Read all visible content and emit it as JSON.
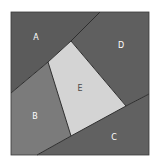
{
  "diagram": {
    "frame": {
      "x": 11,
      "y": 12,
      "width": 138,
      "height": 143,
      "stroke": "#3a3a3a"
    },
    "regions": [
      {
        "id": "A",
        "label": "A",
        "fill": "#5b5b5b",
        "points": "11,12 100,12 71,41 48,62 11,93",
        "label_pos": {
          "x": 36,
          "y": 37
        }
      },
      {
        "id": "D",
        "label": "D",
        "fill": "#5f5f5f",
        "points": "100,12 149,12 149,94 126,106 71,41",
        "label_pos": {
          "x": 121,
          "y": 45
        }
      },
      {
        "id": "E",
        "label": "E",
        "fill": "#d4d4d4",
        "points": "71,41 48,62 71,136 126,106",
        "label_pos": {
          "x": 80,
          "y": 88
        }
      },
      {
        "id": "B",
        "label": "B",
        "fill": "#7b7b7b",
        "points": "11,93 48,62 71,136 37,155 11,155",
        "label_pos": {
          "x": 35,
          "y": 116
        }
      },
      {
        "id": "C",
        "label": "C",
        "fill": "#616161",
        "points": "37,155 71,136 126,106 149,94 149,155",
        "label_pos": {
          "x": 114,
          "y": 137
        }
      }
    ],
    "lines": [
      {
        "id": "A-D-boundary",
        "points": "100,12 71,41"
      },
      {
        "id": "A-E-boundary",
        "points": "71,41 48,62"
      },
      {
        "id": "A-B-boundary",
        "points": "48,62 11,93"
      },
      {
        "id": "D-E-boundary",
        "points": "71,41 126,106"
      },
      {
        "id": "B-E-boundary",
        "points": "48,62 71,136"
      },
      {
        "id": "E-C-boundary",
        "points": "71,136 126,106"
      },
      {
        "id": "D-C-boundary",
        "points": "126,106 149,94"
      },
      {
        "id": "B-C-boundary",
        "points": "71,136 37,155"
      }
    ],
    "line_color": "#2e2e2e"
  }
}
